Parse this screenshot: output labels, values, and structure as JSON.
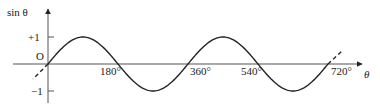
{
  "chart_data": {
    "type": "line",
    "title": "",
    "function": "sin θ",
    "xlabel": "θ",
    "ylabel": "sin θ",
    "origin_label": "O",
    "x_ticks": [
      "180°",
      "360°",
      "540°",
      "720°"
    ],
    "x_tick_values": [
      180,
      360,
      540,
      720
    ],
    "y_ticks": [
      "+1",
      "-1"
    ],
    "y_tick_values": [
      1,
      -1
    ],
    "xlim": [
      0,
      720
    ],
    "ylim": [
      -1,
      1
    ],
    "grid": false,
    "legend": null,
    "series": [
      {
        "name": "sin θ",
        "style": "solid",
        "x": [
          0,
          90,
          180,
          270,
          360,
          450,
          540,
          630,
          720
        ],
        "values": [
          0,
          1,
          0,
          -1,
          0,
          1,
          0,
          -1,
          0
        ]
      },
      {
        "name": "continuation (negative θ)",
        "style": "dashed",
        "x": [
          -40,
          0
        ],
        "values": [
          -0.56,
          0
        ]
      },
      {
        "name": "continuation (beyond 720°)",
        "style": "dashed",
        "x": [
          720,
          755
        ],
        "values": [
          0,
          0.45
        ]
      }
    ]
  },
  "labels": {
    "y_axis": "sin θ",
    "x_axis": "θ",
    "origin": "O",
    "plus_one": "+1",
    "minus_one": "−1",
    "t180": "180°",
    "t360": "360°",
    "t540": "540°",
    "t720": "720°"
  },
  "colors": {
    "stroke": "#222222",
    "axis": "#555555",
    "background": "#ffffff"
  }
}
